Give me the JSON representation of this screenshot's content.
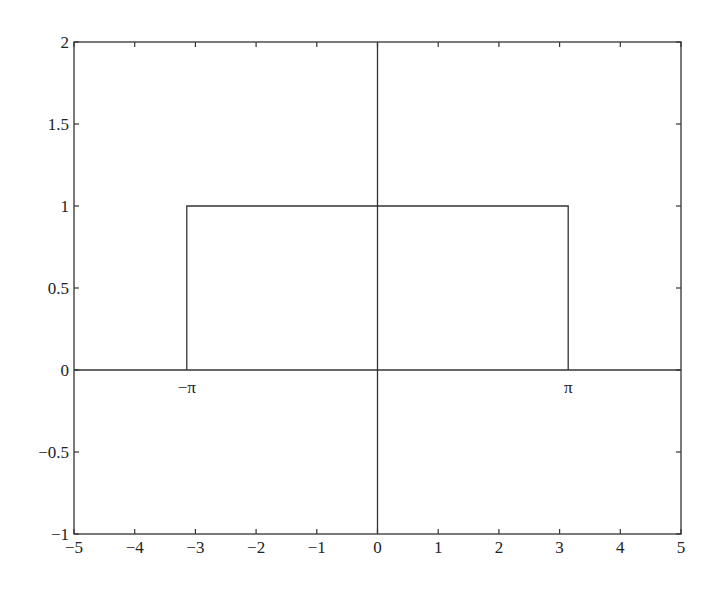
{
  "chart_data": {
    "type": "line",
    "title": "",
    "xlabel": "",
    "ylabel": "",
    "xlim": [
      -5,
      5
    ],
    "ylim": [
      -1,
      2
    ],
    "grid": false,
    "legend": null,
    "x_ticks": [
      -5,
      -4,
      -3,
      -2,
      -1,
      0,
      1,
      2,
      3,
      4,
      5
    ],
    "x_tick_labels": [
      "−5",
      "−4",
      "−3",
      "−2",
      "−1",
      "0",
      "1",
      "2",
      "3",
      "4",
      "5"
    ],
    "y_ticks": [
      -1,
      -0.5,
      0,
      0.5,
      1,
      1.5,
      2
    ],
    "y_tick_labels": [
      "−1",
      "−0.5",
      "0",
      "0.5",
      "1",
      "1.5",
      "2"
    ],
    "series": [
      {
        "name": "rectangular pulse",
        "x": [
          -3.1416,
          -3.1416,
          3.1416,
          3.1416
        ],
        "y": [
          0,
          1,
          1,
          0
        ]
      }
    ],
    "reference_lines": [
      {
        "name": "x-axis",
        "orientation": "horizontal",
        "value": 0
      },
      {
        "name": "y-axis",
        "orientation": "vertical",
        "value": 0
      }
    ],
    "annotations": [
      {
        "text": "−π",
        "x": -3.1416,
        "y": -0.1
      },
      {
        "text": "π",
        "x": 3.1416,
        "y": -0.1
      }
    ]
  }
}
